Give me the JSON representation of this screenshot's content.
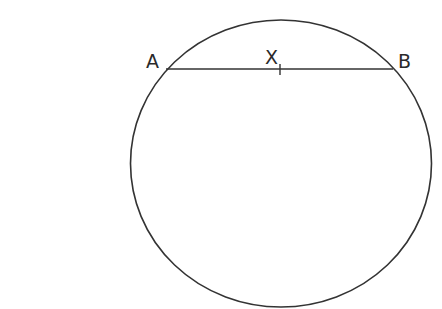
{
  "diagram": {
    "type": "geometry",
    "colors": {
      "stroke": "#333333",
      "background": "#ffffff",
      "label": "#2a2a2a"
    },
    "circle": {
      "cx": 281,
      "cy": 163.5,
      "rx": 150.5,
      "ry": 143.5
    },
    "chord": {
      "name": "AB",
      "x1": 166,
      "y1": 69,
      "x2": 393,
      "y2": 69
    },
    "points": [
      {
        "id": "A",
        "label": "A",
        "x": 166,
        "y": 69,
        "label_x": 146,
        "label_y": 68
      },
      {
        "id": "X",
        "label": "X",
        "x": 280,
        "y": 69,
        "label_x": 265,
        "label_y": 64
      },
      {
        "id": "B",
        "label": "B",
        "x": 393,
        "y": 69,
        "label_x": 398,
        "label_y": 68
      }
    ],
    "tick": {
      "at": "X",
      "x": 280,
      "y1": 64,
      "y2": 75
    }
  }
}
